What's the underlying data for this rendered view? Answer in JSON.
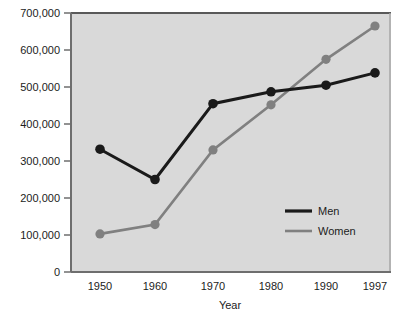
{
  "chart_data": {
    "type": "line",
    "title": "",
    "xlabel": "Year",
    "ylabel": "",
    "categories": [
      "1950",
      "1960",
      "1970",
      "1980",
      "1990",
      "1997"
    ],
    "series": [
      {
        "name": "Men",
        "color": "#1a1a1a",
        "values": [
          332000,
          250000,
          455000,
          487000,
          505000,
          538000
        ]
      },
      {
        "name": "Women",
        "color": "#808080",
        "values": [
          103000,
          128000,
          330000,
          452000,
          575000,
          665000
        ]
      }
    ],
    "ylim": [
      0,
      700000
    ],
    "yticks": [
      0,
      100000,
      200000,
      300000,
      400000,
      500000,
      600000,
      700000
    ],
    "ytick_labels": [
      "0",
      "100,000",
      "200,000",
      "300,000",
      "400,000",
      "500,000",
      "600,000",
      "700,000"
    ],
    "grid": false,
    "legend_position": "inside-lower-right",
    "plot_background": "#d9d9d9",
    "marker": "circle"
  },
  "axes": {
    "x_axis_title": "Year",
    "y_axis_title": ""
  },
  "legend": {
    "entries": [
      {
        "label": "Men",
        "color": "#1a1a1a"
      },
      {
        "label": "Women",
        "color": "#808080"
      }
    ]
  }
}
